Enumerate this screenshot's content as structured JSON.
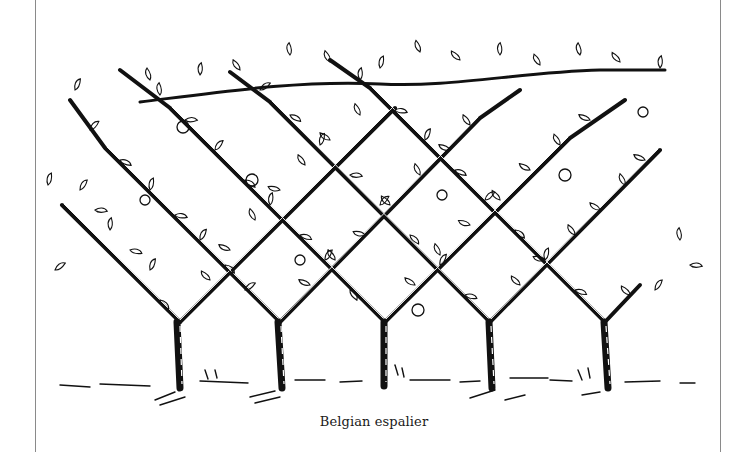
{
  "figure": {
    "caption": "Belgian espalier",
    "tree_count": 5,
    "colors": {
      "ink": "#111111",
      "frame": "#8a8a8a",
      "paper": "#ffffff"
    }
  }
}
